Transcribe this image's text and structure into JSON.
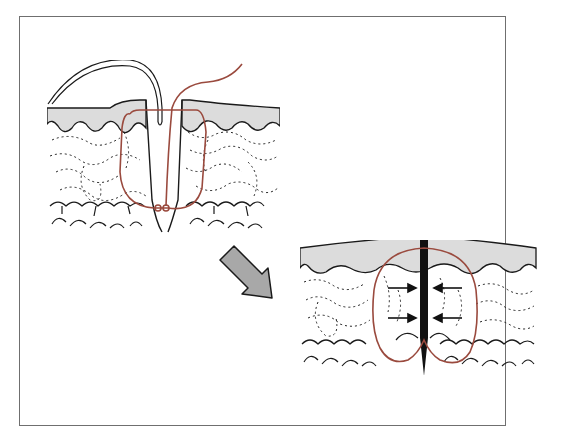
{
  "figure": {
    "title": "",
    "panels": [
      {
        "id": "before",
        "label": "needle-and-suture-through-incision"
      },
      {
        "id": "after",
        "label": "closed-wound-with-approximation-arrows"
      }
    ],
    "arrow": {
      "direction": "down-right",
      "meaning": "transition"
    },
    "colors": {
      "suture": "#9a4a3e",
      "epidermis": "#dcdcdc",
      "outline": "#1a1a1a",
      "arrow_fill": "#a8a8a8",
      "frame": "#6f6f6f"
    }
  }
}
